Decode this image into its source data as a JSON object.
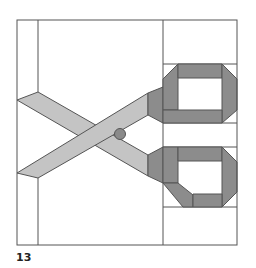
{
  "figure": {
    "label": "13",
    "colors": {
      "background": "#ffffff",
      "line": "#555555",
      "blade_fill": "#c4c4c4",
      "handle_fill": "#8c8c8c",
      "pivot_fill": "#8a8a8a"
    }
  }
}
